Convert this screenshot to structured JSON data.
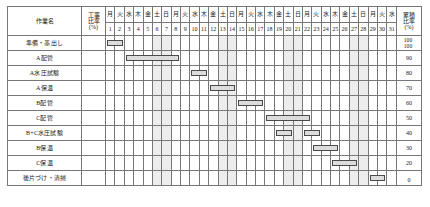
{
  "header": {
    "task_column_label": "作業名",
    "ratio_column_label_line1": "工事",
    "ratio_column_label_line2": "比率",
    "ratio_column_label_line3": "(%)",
    "cumulative_column_label_line1": "累積",
    "cumulative_column_label_line2": "比率",
    "cumulative_column_label_line3": "(%)",
    "weekdays": [
      "月",
      "火",
      "水",
      "木",
      "金",
      "土",
      "日",
      "月",
      "火",
      "水",
      "木",
      "金",
      "土",
      "日",
      "月",
      "火",
      "水",
      "木",
      "金",
      "土",
      "日",
      "月",
      "火",
      "水",
      "木",
      "金",
      "土",
      "日",
      "月",
      "火",
      "水"
    ],
    "days": [
      "1",
      "2",
      "3",
      "4",
      "5",
      "6",
      "7",
      "8",
      "9",
      "10",
      "11",
      "12",
      "13",
      "14",
      "15",
      "16",
      "17",
      "18",
      "19",
      "20",
      "21",
      "22",
      "23",
      "24",
      "25",
      "26",
      "27",
      "28",
      "29",
      "30",
      "31"
    ],
    "weekend_indices": [
      5,
      6,
      12,
      13,
      19,
      20,
      26,
      27
    ]
  },
  "chart_data": {
    "type": "bar",
    "xlabel": "日",
    "ylabel": "累積比率(%)",
    "categories": [
      "準備・墨出し",
      "A配管",
      "A水圧試験",
      "A保温",
      "B配管",
      "C配管",
      "B+C水圧試験",
      "B保温",
      "C保温",
      "後片づけ・清掃"
    ],
    "x": [
      1,
      2,
      3,
      4,
      5,
      6,
      7,
      8,
      9,
      10,
      11,
      12,
      13,
      14,
      15,
      16,
      17,
      18,
      19,
      20,
      21,
      22,
      23,
      24,
      25,
      26,
      27,
      28,
      29,
      30,
      31
    ],
    "xlim": [
      1,
      31
    ],
    "ylim": [
      0,
      100
    ],
    "ytick_labels": [
      "100",
      "90",
      "80",
      "70",
      "60",
      "50",
      "40",
      "30",
      "20",
      "10",
      "0"
    ],
    "grid": true,
    "legend": "none",
    "tasks": [
      {
        "name": "準備・墨出し",
        "ratio": "",
        "cumulative": "100",
        "spans": [
          {
            "start": 1,
            "end": 2
          }
        ]
      },
      {
        "name": "A配管",
        "ratio": "",
        "cumulative": "90",
        "spans": [
          {
            "start": 3,
            "end": 8
          }
        ]
      },
      {
        "name": "A水圧試験",
        "ratio": "",
        "cumulative": "80",
        "spans": [
          {
            "start": 10,
            "end": 11
          }
        ]
      },
      {
        "name": "A保温",
        "ratio": "",
        "cumulative": "70",
        "spans": [
          {
            "start": 12,
            "end": 14
          }
        ]
      },
      {
        "name": "B配管",
        "ratio": "",
        "cumulative": "60",
        "spans": [
          {
            "start": 15,
            "end": 17
          }
        ]
      },
      {
        "name": "C配管",
        "ratio": "",
        "cumulative": "50",
        "spans": [
          {
            "start": 18,
            "end": 22
          }
        ]
      },
      {
        "name": "B+C水圧試験",
        "ratio": "",
        "cumulative": "40",
        "spans": [
          {
            "start": 19,
            "end": 20
          },
          {
            "start": 22,
            "end": 23
          }
        ]
      },
      {
        "name": "B保温",
        "ratio": "",
        "cumulative": "30",
        "spans": [
          {
            "start": 23,
            "end": 25
          }
        ]
      },
      {
        "name": "C保温",
        "ratio": "",
        "cumulative": "20",
        "spans": [
          {
            "start": 25,
            "end": 27
          }
        ]
      },
      {
        "name": "後片づけ・清掃",
        "ratio": "",
        "cumulative": "10",
        "spans": [
          {
            "start": 29,
            "end": 30
          }
        ]
      }
    ],
    "extra_cumulative_top": "100",
    "cumulative_scale": [
      "100",
      "90",
      "80",
      "70",
      "60",
      "50",
      "40",
      "30",
      "20",
      "10",
      "0"
    ]
  }
}
